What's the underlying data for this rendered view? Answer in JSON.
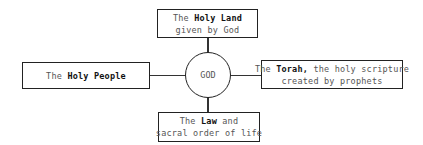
{
  "diagram": {
    "center": {
      "label": "GOD"
    },
    "top": {
      "line1_pre": "The ",
      "line1_bold": "Holy Land",
      "line1_post": "",
      "line2": "given by God"
    },
    "left": {
      "line1_pre": "The ",
      "line1_bold": "Holy People",
      "line1_post": ""
    },
    "right": {
      "line1_pre": "The ",
      "line1_bold": "Torah,",
      "line1_post": " the holy scripture",
      "line2": "created by prophets"
    },
    "bottom": {
      "line1_pre": "The ",
      "line1_bold": "Law",
      "line1_post": " and",
      "line2": "sacral order of life"
    }
  }
}
